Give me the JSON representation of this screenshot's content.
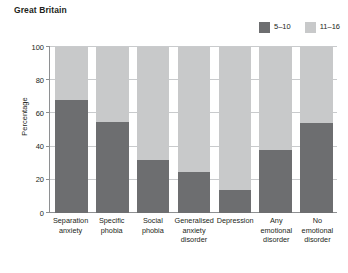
{
  "chart_data": {
    "type": "bar",
    "subtype": "stacked-100-percent",
    "title": "Great Britain",
    "xlabel": "",
    "ylabel": "Percentage",
    "ylim": [
      0,
      100
    ],
    "yticks": [
      0,
      20,
      40,
      60,
      80,
      100
    ],
    "ytick_labels": [
      "0",
      "20",
      "40",
      "60",
      "80",
      "100"
    ],
    "grid": "horizontal",
    "legend_position": "top-right",
    "categories": [
      "Separation anxiety",
      "Specific phobia",
      "Social phobia",
      "Generalised anxiety disorder",
      "Depression",
      "Any emotional disorder",
      "No emotional disorder"
    ],
    "series": [
      {
        "name": "5–10",
        "color": "#6d6e70",
        "values": [
          68,
          55,
          32,
          25,
          14,
          38,
          54
        ]
      },
      {
        "name": "11–16",
        "color": "#c8c9ca",
        "values": [
          32,
          45,
          68,
          75,
          86,
          62,
          46
        ]
      }
    ]
  },
  "legend": {
    "items": [
      {
        "label": "5–10",
        "color": "#6d6e70"
      },
      {
        "label": "11–16",
        "color": "#c8c9ca"
      }
    ]
  },
  "axis": {
    "y_title": "Percentage"
  }
}
